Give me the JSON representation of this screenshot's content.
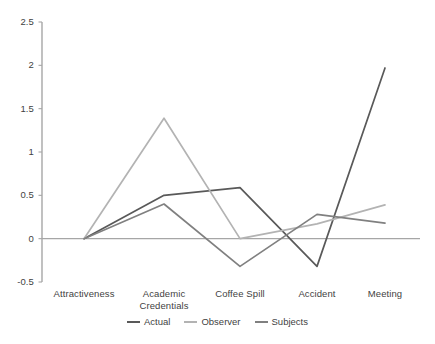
{
  "chart_data": {
    "type": "line",
    "title": "",
    "subtitle": "",
    "xlabel": "",
    "ylabel": "",
    "categories": [
      "Attractiveness",
      "Academic Credentials",
      "Coffee Spill",
      "Accident",
      "Meeting"
    ],
    "category_labels_display": [
      "Attractiveness",
      "Academic\nCredentials",
      "Coffee Spill",
      "Accident",
      "Meeting"
    ],
    "series": [
      {
        "name": "Actual",
        "color": "#595959",
        "values": [
          0,
          0.5,
          0.59,
          -0.32,
          1.97
        ]
      },
      {
        "name": "Observer",
        "color": "#b3b3b3",
        "values": [
          0,
          1.39,
          0.0,
          0.17,
          0.39
        ]
      },
      {
        "name": "Subjects",
        "color": "#808080",
        "values": [
          0,
          0.4,
          -0.32,
          0.28,
          0.18
        ]
      }
    ],
    "ylim": [
      -0.5,
      2.5
    ],
    "ytick_values": [
      -0.5,
      0,
      0.5,
      1,
      1.5,
      2,
      2.5
    ],
    "ytick_labels": [
      "-0.5",
      "0",
      "0.5",
      "1",
      "1.5",
      "2",
      "2.5"
    ],
    "grid": false,
    "legend_position": "bottom",
    "zero_line": true,
    "axis_color": "#a6a6a6",
    "text_color": "#3f3f3f",
    "background": "#ffffff"
  },
  "legend": {
    "entries": [
      {
        "label": "Actual"
      },
      {
        "label": "Observer"
      },
      {
        "label": "Subjects"
      }
    ]
  }
}
